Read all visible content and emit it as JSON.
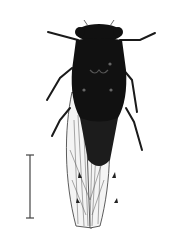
{
  "image": {
    "subject": "cicada specimen, dorsal view",
    "background_color": "#ffffff",
    "specimen_color": "#111111",
    "wing_color": "#f4f4f4",
    "vein_color": "#333333"
  },
  "scale_bar": {
    "label": "",
    "color": "#444444"
  }
}
